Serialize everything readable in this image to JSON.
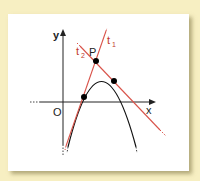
{
  "diagram": {
    "labels": {
      "y_axis": "y",
      "x_axis": "x",
      "origin": "O",
      "point": "P",
      "tangent1": "t",
      "tangent1_sub": "1",
      "tangent2": "t",
      "tangent2_sub": "2"
    },
    "colors": {
      "background": "#f7efc2",
      "panel": "#ffffff",
      "axes": "#222222",
      "curve": "#111111",
      "tangent": "#d9534a",
      "tangent_label": "#c0392b",
      "points": "#000000"
    },
    "points": {
      "P": [
        96,
        61
      ],
      "tangent_point_1": [
        84,
        97
      ],
      "tangent_point_2": [
        114,
        81
      ]
    }
  }
}
